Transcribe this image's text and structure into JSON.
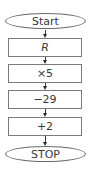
{
  "flowchart": {
    "start": {
      "label": "Start",
      "shape": "ellipse"
    },
    "steps": [
      {
        "label": "R",
        "shape": "rectangle",
        "italic": true
      },
      {
        "label": "×5",
        "shape": "rectangle"
      },
      {
        "label": "−29",
        "shape": "rectangle"
      },
      {
        "label": "+2",
        "shape": "rectangle"
      }
    ],
    "end": {
      "label": "STOP",
      "shape": "ellipse"
    },
    "arrow_count": 5,
    "colors": {
      "stroke": "#6a6a6a",
      "text": "#3a3a3a",
      "background": "#ffffff"
    }
  }
}
